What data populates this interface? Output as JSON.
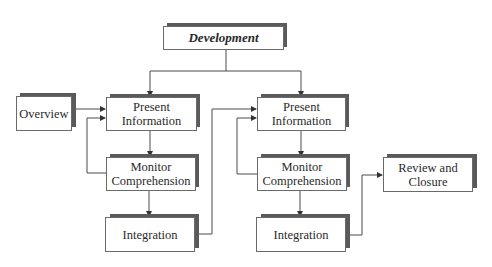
{
  "diagram": {
    "title_node": {
      "label": "Development"
    },
    "left_column": {
      "overview": {
        "label": "Overview"
      },
      "present_information": {
        "label_line1": "Present",
        "label_line2": "Information"
      },
      "monitor_comprehension": {
        "label_line1": "Monitor",
        "label_line2": "Comprehension"
      },
      "integration": {
        "label": "Integration"
      }
    },
    "right_column": {
      "present_information": {
        "label_line1": "Present",
        "label_line2": "Information"
      },
      "monitor_comprehension": {
        "label_line1": "Monitor",
        "label_line2": "Comprehension"
      },
      "integration": {
        "label": "Integration"
      },
      "review_and_closure": {
        "label_line1": "Review and",
        "label_line2": "Closure"
      }
    },
    "colors": {
      "box_border": "#6a6a6a",
      "shadow": "#5a5a5a",
      "line": "#4a4a4a",
      "background": "#ffffff"
    }
  }
}
